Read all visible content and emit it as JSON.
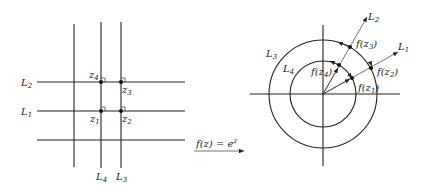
{
  "diagram": {
    "type": "conformal-mapping",
    "mapping_label": "f(z) = e^z",
    "mapping": {
      "prefix": "f(z) = e",
      "exponent": "z"
    },
    "left_plane": {
      "horizontal_lines": [
        {
          "name": "L",
          "sub": "2",
          "y": 82
        },
        {
          "name": "L",
          "sub": "1",
          "y": 111
        },
        {
          "name": "",
          "sub": "",
          "y": 140
        }
      ],
      "vertical_lines": [
        {
          "name": "",
          "sub": "",
          "x": 74
        },
        {
          "name": "L",
          "sub": "4",
          "x": 101
        },
        {
          "name": "L",
          "sub": "3",
          "x": 121
        }
      ],
      "points": [
        {
          "label": "z",
          "sub": "4",
          "x": 101,
          "y": 82
        },
        {
          "label": "z",
          "sub": "3",
          "x": 121,
          "y": 82
        },
        {
          "label": "z",
          "sub": "1",
          "x": 101,
          "y": 111
        },
        {
          "label": "z",
          "sub": "2",
          "x": 121,
          "y": 111
        }
      ]
    },
    "right_plane": {
      "center": [
        323,
        94
      ],
      "circles": [
        {
          "name": "L",
          "sub": "4",
          "r": 33
        },
        {
          "name": "L",
          "sub": "3",
          "r": 54
        }
      ],
      "rays": [
        {
          "name": "L",
          "sub": "2"
        },
        {
          "name": "L",
          "sub": "1"
        }
      ],
      "points": [
        {
          "label": "f(z",
          "sub": "4"
        },
        {
          "label": "f(z",
          "sub": "3"
        },
        {
          "label": "f(z",
          "sub": "2"
        },
        {
          "label": "f(z",
          "sub": "1"
        }
      ]
    },
    "colors": {
      "ink": "#222222",
      "background": "#ffffff"
    }
  }
}
